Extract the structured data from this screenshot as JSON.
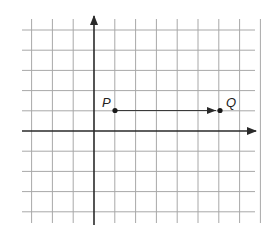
{
  "diagram": {
    "type": "coordinate-grid-translation",
    "grid": {
      "x_range": [
        -3,
        7
      ],
      "y_range": [
        -4,
        5
      ],
      "show_grid": true,
      "axis_arrows": [
        "positive-x",
        "positive-y"
      ]
    },
    "points": [
      {
        "label": "P",
        "x": 1,
        "y": 1
      },
      {
        "label": "Q",
        "x": 6,
        "y": 1
      }
    ],
    "vector": {
      "from": "P",
      "to": "Q"
    },
    "colors": {
      "grid": "#a8a8a8",
      "axes": "#2a2a2a",
      "points": "#1a1a1a"
    }
  }
}
